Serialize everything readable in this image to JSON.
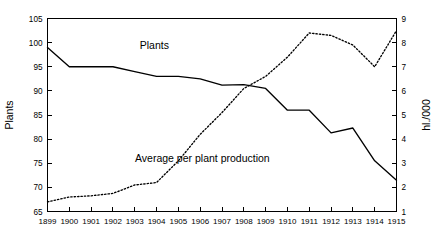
{
  "chart_data": {
    "type": "line",
    "title": "",
    "xlabel": "",
    "ylabel": "Plants",
    "y2label": "hl./000",
    "grid": false,
    "legend": "inline-annotations",
    "x": [
      1899,
      1900,
      1901,
      1902,
      1903,
      1904,
      1905,
      1906,
      1907,
      1908,
      1909,
      1910,
      1911,
      1912,
      1913,
      1914,
      1915
    ],
    "xtick_labels": [
      "1899",
      "1900",
      "1901",
      "1902",
      "1903",
      "1904",
      "1905",
      "1906",
      "1907",
      "1908",
      "1909",
      "1910",
      "1911",
      "1912",
      "1913",
      "1914",
      "1915"
    ],
    "ylim": [
      65,
      105
    ],
    "ytick_labels": [
      "65",
      "70",
      "75",
      "80",
      "85",
      "90",
      "95",
      "100",
      "105"
    ],
    "ytick_values": [
      65,
      70,
      75,
      80,
      85,
      90,
      95,
      100,
      105
    ],
    "y2lim": [
      1,
      9
    ],
    "y2tick_labels": [
      "1",
      "2",
      "3",
      "4",
      "5",
      "6",
      "7",
      "8",
      "9"
    ],
    "y2tick_values": [
      1,
      2,
      3,
      4,
      5,
      6,
      7,
      8,
      9
    ],
    "series": [
      {
        "name": "Plants",
        "label": "Plants",
        "style": "solid",
        "axis": "left",
        "values": [
          99,
          95,
          95,
          95,
          94,
          93,
          93,
          92.5,
          91.2,
          91.3,
          90.5,
          86,
          86,
          81.3,
          82.3,
          75.5,
          71.5
        ]
      },
      {
        "name": "Average per plant production",
        "label": "Average per plant production",
        "style": "dotted",
        "axis": "right",
        "values": [
          1.4,
          1.6,
          1.65,
          1.75,
          2.1,
          2.2,
          3.1,
          4.2,
          5.1,
          6.1,
          6.6,
          7.4,
          8.4,
          8.3,
          7.9,
          7.0,
          8.5
        ]
      }
    ],
    "annotations": [
      {
        "text": "Plants",
        "x": 1903.9,
        "y_frac": 0.84
      },
      {
        "text": "Average per plant production",
        "x": 1906.1,
        "y_frac": 0.255
      }
    ],
    "colors": {
      "line": "#000000",
      "axis": "#000000",
      "background": "#ffffff"
    }
  }
}
